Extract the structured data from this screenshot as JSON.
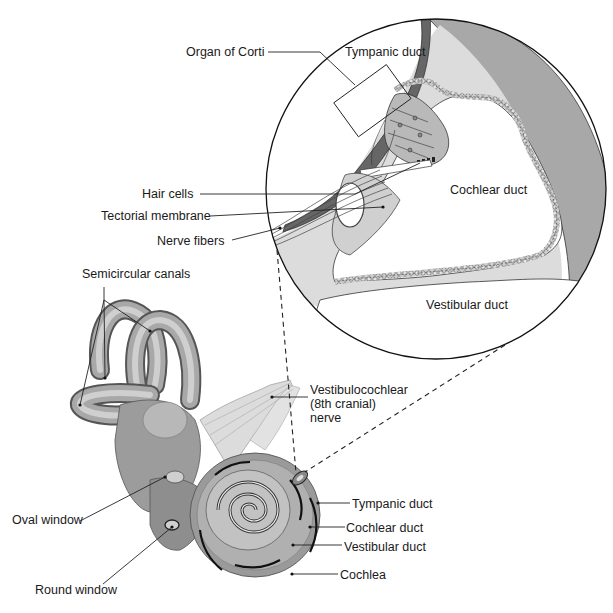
{
  "diagram": {
    "type": "anatomical-illustration",
    "magnified_view": {
      "labels": {
        "organ_of_corti": "Organ of Corti",
        "tympanic_duct": "Tympanic duct",
        "hair_cells": "Hair cells",
        "tectorial_membrane": "Tectorial membrane",
        "nerve_fibers": "Nerve fibers",
        "cochlear_duct": "Cochlear duct",
        "vestibular_duct": "Vestibular duct"
      }
    },
    "inner_ear": {
      "labels": {
        "semicircular_canals": "Semicircular canals",
        "vestibulocochlear_nerve": "Vestibulocochlear\n(8th cranial)\nnerve",
        "oval_window": "Oval window",
        "round_window": "Round window",
        "tympanic_duct": "Tympanic duct",
        "cochlear_duct": "Cochlear duct",
        "vestibular_duct": "Vestibular duct",
        "cochlea": "Cochlea"
      }
    },
    "colors": {
      "background": "#ffffff",
      "outline": "#1a1a1a",
      "dark_gray": "#6e6e6e",
      "mid_gray": "#9a9a9a",
      "light_gray": "#c8c8c8",
      "pale_gray": "#dedede",
      "text": "#1a1a1a"
    }
  }
}
